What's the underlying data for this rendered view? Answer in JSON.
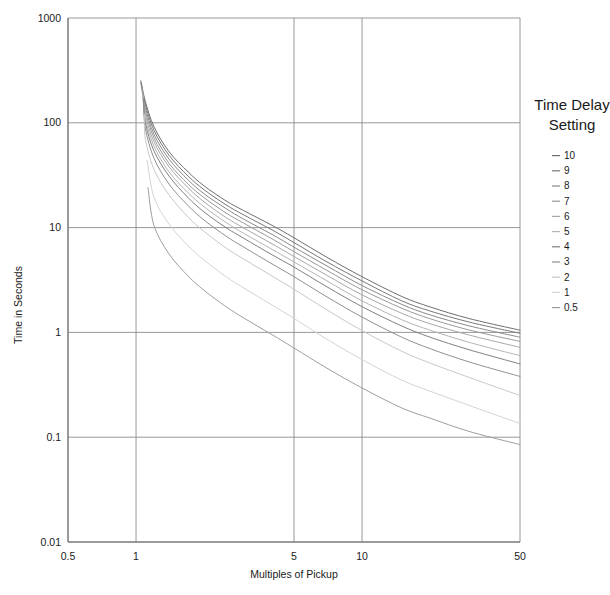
{
  "chart_data": {
    "type": "line",
    "title": "",
    "xlabel": "Multiples of Pickup",
    "ylabel": "Time in Seconds",
    "xscale": "log",
    "yscale": "log",
    "xlim": [
      0.5,
      50
    ],
    "ylim": [
      0.01,
      1000
    ],
    "xticks": [
      "0.5",
      "1",
      "5",
      "10",
      "50"
    ],
    "xtick_values": [
      0.5,
      1,
      5,
      10,
      50
    ],
    "yticks": [
      "0.01",
      "0.1",
      "1",
      "10",
      "100",
      "1000"
    ],
    "ytick_values": [
      0.01,
      0.1,
      1,
      10,
      100,
      1000
    ],
    "grid": true,
    "legend_position": "right",
    "legend_title": "Time Delay Setting",
    "x_start": 1.05,
    "series": [
      {
        "name": "10",
        "color": "#6f6f6f",
        "asymptote": 1.05,
        "scale": 12.0,
        "x_start": 1.05,
        "y_start": 252,
        "x": [
          1.05,
          1.1,
          1.2,
          1.4,
          1.7,
          2,
          2.5,
          3,
          4,
          5,
          7,
          10,
          15,
          20,
          30,
          50
        ],
        "values": [
          252,
          160,
          92,
          53,
          34,
          25,
          18,
          14.5,
          10.5,
          8.0,
          5.2,
          3.4,
          2.2,
          1.75,
          1.35,
          1.05
        ]
      },
      {
        "name": "9",
        "color": "#787878",
        "asymptote": 0.98,
        "scale": 10.8,
        "x_start": 1.05,
        "y_start": 240,
        "x": [
          1.05,
          1.1,
          1.2,
          1.4,
          1.7,
          2,
          2.5,
          3,
          4,
          5,
          7,
          10,
          15,
          20,
          30,
          50
        ],
        "values": [
          240,
          150,
          85,
          49,
          31,
          23,
          16.5,
          13.2,
          9.5,
          7.2,
          4.7,
          3.1,
          2.0,
          1.6,
          1.25,
          0.98
        ]
      },
      {
        "name": "8",
        "color": "#8a8a8a",
        "asymptote": 0.9,
        "scale": 9.6,
        "x_start": 1.06,
        "y_start": 228,
        "x": [
          1.06,
          1.1,
          1.2,
          1.4,
          1.7,
          2,
          2.5,
          3,
          4,
          5,
          7,
          10,
          15,
          20,
          30,
          50
        ],
        "values": [
          228,
          140,
          78,
          45,
          28.5,
          21,
          15.2,
          12.0,
          8.6,
          6.5,
          4.3,
          2.8,
          1.85,
          1.47,
          1.15,
          0.9
        ]
      },
      {
        "name": "7",
        "color": "#9a9a9a",
        "asymptote": 0.82,
        "scale": 8.4,
        "x_start": 1.06,
        "y_start": 215,
        "x": [
          1.06,
          1.1,
          1.2,
          1.4,
          1.7,
          2,
          2.5,
          3,
          4,
          5,
          7,
          10,
          15,
          20,
          30,
          50
        ],
        "values": [
          215,
          130,
          72,
          41,
          26,
          19.3,
          13.8,
          11.0,
          7.8,
          5.9,
          3.9,
          2.55,
          1.7,
          1.35,
          1.05,
          0.82
        ]
      },
      {
        "name": "6",
        "color": "#a8a8a8",
        "asymptote": 0.72,
        "scale": 7.2,
        "x_start": 1.07,
        "y_start": 200,
        "x": [
          1.07,
          1.1,
          1.2,
          1.4,
          1.7,
          2,
          2.5,
          3,
          4,
          5,
          7,
          10,
          15,
          20,
          30,
          50
        ],
        "values": [
          200,
          120,
          66,
          38,
          24,
          17.6,
          12.5,
          9.9,
          7.0,
          5.3,
          3.5,
          2.28,
          1.52,
          1.21,
          0.94,
          0.72
        ]
      },
      {
        "name": "5",
        "color": "#b4b4b4",
        "asymptote": 0.6,
        "scale": 6.0,
        "x_start": 1.07,
        "y_start": 185,
        "x": [
          1.07,
          1.1,
          1.2,
          1.4,
          1.7,
          2,
          2.5,
          3,
          4,
          5,
          7,
          10,
          15,
          20,
          30,
          50
        ],
        "values": [
          185,
          110,
          60,
          34,
          21.5,
          15.8,
          11.2,
          8.8,
          6.2,
          4.7,
          3.1,
          2.0,
          1.32,
          1.05,
          0.8,
          0.6
        ]
      },
      {
        "name": "4",
        "color": "#808080",
        "asymptote": 0.5,
        "scale": 4.8,
        "x_start": 1.08,
        "y_start": 168,
        "x": [
          1.08,
          1.1,
          1.2,
          1.4,
          1.7,
          2,
          2.5,
          3,
          4,
          5,
          7,
          10,
          15,
          20,
          30,
          50
        ],
        "values": [
          168,
          100,
          54,
          31,
          19.3,
          14.1,
          10.0,
          7.9,
          5.5,
          4.2,
          2.72,
          1.76,
          1.15,
          0.9,
          0.68,
          0.5
        ]
      },
      {
        "name": "3",
        "color": "#909090",
        "asymptote": 0.38,
        "scale": 3.6,
        "x_start": 1.08,
        "y_start": 150,
        "x": [
          1.08,
          1.1,
          1.2,
          1.4,
          1.7,
          2,
          2.5,
          3,
          4,
          5,
          7,
          10,
          15,
          20,
          30,
          50
        ],
        "values": [
          150,
          88,
          46,
          26,
          16.2,
          11.8,
          8.3,
          6.5,
          4.5,
          3.4,
          2.18,
          1.4,
          0.9,
          0.7,
          0.52,
          0.38
        ]
      },
      {
        "name": "2",
        "color": "#c8c8c8",
        "asymptote": 0.25,
        "scale": 2.4,
        "x_start": 1.09,
        "y_start": 120,
        "x": [
          1.09,
          1.1,
          1.2,
          1.4,
          1.7,
          2,
          2.5,
          3,
          4,
          5,
          7,
          10,
          15,
          20,
          30,
          50
        ],
        "values": [
          120,
          70,
          36,
          20.5,
          12.6,
          9.2,
          6.4,
          5.0,
          3.45,
          2.58,
          1.64,
          1.04,
          0.66,
          0.51,
          0.37,
          0.25
        ]
      },
      {
        "name": "1",
        "color": "#d4d4d4",
        "asymptote": 0.135,
        "scale": 1.2,
        "x_start": 1.12,
        "y_start": 44,
        "x": [
          1.12,
          1.2,
          1.4,
          1.7,
          2,
          2.5,
          3,
          4,
          5,
          7,
          10,
          15,
          20,
          30,
          50
        ],
        "values": [
          44,
          19.5,
          10.8,
          6.7,
          4.9,
          3.4,
          2.65,
          1.82,
          1.36,
          0.86,
          0.55,
          0.35,
          0.275,
          0.2,
          0.135
        ]
      },
      {
        "name": "0.5",
        "color": "#9e9e9e",
        "asymptote": 0.085,
        "scale": 0.6,
        "x_start": 1.13,
        "y_start": 24,
        "x": [
          1.13,
          1.2,
          1.4,
          1.7,
          2,
          2.5,
          3,
          4,
          5,
          7,
          10,
          15,
          20,
          30,
          50
        ],
        "values": [
          24,
          10.5,
          5.6,
          3.45,
          2.52,
          1.76,
          1.37,
          0.95,
          0.71,
          0.455,
          0.295,
          0.19,
          0.152,
          0.113,
          0.085
        ]
      }
    ]
  },
  "legend": {
    "title_line1": "Time Delay",
    "title_line2": "Setting",
    "items": [
      {
        "label": "10",
        "color": "#6f6f6f"
      },
      {
        "label": "9",
        "color": "#787878"
      },
      {
        "label": "8",
        "color": "#8a8a8a"
      },
      {
        "label": "7",
        "color": "#9a9a9a"
      },
      {
        "label": "6",
        "color": "#a8a8a8"
      },
      {
        "label": "5",
        "color": "#b4b4b4"
      },
      {
        "label": "4",
        "color": "#808080"
      },
      {
        "label": "3",
        "color": "#909090"
      },
      {
        "label": "2",
        "color": "#c8c8c8"
      },
      {
        "label": "1",
        "color": "#d4d4d4"
      },
      {
        "label": "0.5",
        "color": "#9e9e9e"
      }
    ]
  },
  "axes": {
    "x_title": "Multiples of Pickup",
    "y_title": "Time in Seconds"
  },
  "colors": {
    "grid": "#8c8c8c",
    "axis": "#6b6b6b",
    "text": "#1a1a1a",
    "background": "#ffffff"
  }
}
